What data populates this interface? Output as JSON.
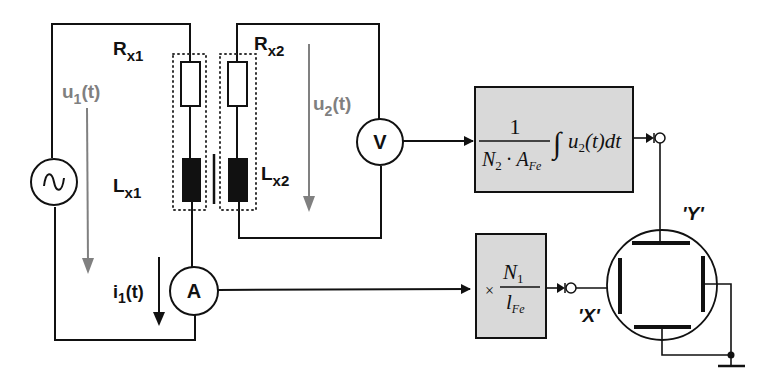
{
  "diagram": {
    "type": "circuit-schematic",
    "primary": {
      "resistor_label": "R",
      "resistor_sub": "x1",
      "inductor_label": "L",
      "inductor_sub": "x1",
      "voltage_label": "u",
      "voltage_sub": "1",
      "voltage_suffix": "(t)",
      "current_label": "i",
      "current_sub": "1",
      "current_suffix": "(t)",
      "source_symbol": "∿",
      "ammeter_label": "A"
    },
    "secondary": {
      "resistor_label": "R",
      "resistor_sub": "x2",
      "inductor_label": "L",
      "inductor_sub": "x2",
      "voltage_label": "u",
      "voltage_sub": "2",
      "voltage_suffix": "(t)",
      "voltmeter_label": "V"
    },
    "integrator_block": {
      "numerator": "1",
      "denom_n": "N",
      "denom_n_sub": "2",
      "denom_dot": "·",
      "denom_a": "A",
      "denom_a_sub": "Fe",
      "integral": "∫",
      "integrand_u": "u",
      "integrand_sub": "2",
      "integrand_rest": "(t)dt"
    },
    "scaling_block": {
      "times": "×",
      "numerator_n": "N",
      "numerator_sub": "1",
      "denominator_l": "l",
      "denominator_sub": "Fe"
    },
    "oscilloscope": {
      "y_label": "'Y'",
      "x_label": "'X'"
    },
    "colors": {
      "wire": "#111111",
      "arrow_gray": "#808080",
      "block_fill": "#d9d9d9"
    }
  }
}
